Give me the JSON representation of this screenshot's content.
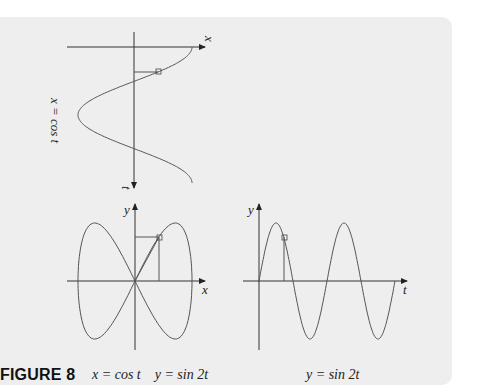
{
  "figure": {
    "label": "FIGURE 8",
    "panels": {
      "top": {
        "curve_label": "x = cos t",
        "horizontal_axis_label": "x",
        "vertical_axis_label": "t"
      },
      "bottom_left": {
        "caption": "x = cos t    y = sin 2t",
        "x_axis_label": "x",
        "y_axis_label": "y"
      },
      "bottom_right": {
        "caption": "y = sin 2t",
        "x_axis_label": "t",
        "y_axis_label": "y"
      }
    }
  },
  "chart_data": [
    {
      "type": "line",
      "title": "x = cos t (plotted with t axis pointing down)",
      "xlabel": "x",
      "ylabel": "t",
      "t_range": [
        0,
        6.2832
      ],
      "x_range": [
        -1,
        1
      ],
      "marker": {
        "t": 0.785,
        "x": 0.707
      }
    },
    {
      "type": "line",
      "title": "x = cos t, y = sin 2t (parametric figure-eight)",
      "xlabel": "x",
      "ylabel": "y",
      "x_range": [
        -1,
        1
      ],
      "y_range": [
        -1,
        1
      ],
      "marker": {
        "x": 0.707,
        "y": 1.0
      }
    },
    {
      "type": "line",
      "title": "y = sin 2t",
      "xlabel": "t",
      "ylabel": "y",
      "t_range": [
        0,
        6.2832
      ],
      "y_range": [
        -1,
        1
      ],
      "marker": {
        "t": 0.785,
        "y": 1.0
      }
    }
  ],
  "colors": {
    "panel_background": "#eeeeee",
    "curve": "#555555",
    "axis": "#333333"
  }
}
